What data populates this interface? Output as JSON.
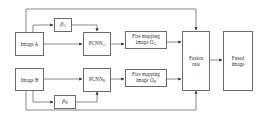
{
  "diagram": {
    "nodes": {
      "image_a": {
        "label": "Image A"
      },
      "beta_a": {
        "symbol": "β",
        "sub": "A"
      },
      "pcnn_a": {
        "label": "PCNN",
        "sub": "A"
      },
      "fire_a": {
        "line1": "Fire mapping",
        "line2": "image O",
        "sub": "A"
      },
      "image_b": {
        "label": "Image B"
      },
      "beta_b": {
        "symbol": "β",
        "sub": "B"
      },
      "pcnn_b": {
        "label": "PCNN",
        "sub": "B"
      },
      "fire_b": {
        "line1": "Fire mapping",
        "line2": "image O",
        "sub": "B"
      },
      "fusion": {
        "line1": "Fusion",
        "line2": "rule"
      },
      "fused": {
        "line1": "Fused",
        "line2": "image"
      }
    },
    "edges": [
      "Image A -> β_A",
      "β_A -> PCNN_A",
      "Image A -> PCNN_A",
      "PCNN_A -> Fire mapping image O_A",
      "Fire mapping image O_A -> Fusion rule",
      "Image A -> Fusion rule (top)",
      "Image B -> β_B",
      "β_B -> PCNN_B",
      "Image B -> PCNN_B",
      "PCNN_B -> Fire mapping image O_B",
      "Fire mapping image O_B -> Fusion rule",
      "Image B -> Fusion rule (bottom)",
      "Fusion rule -> Fused image"
    ],
    "colors": {
      "stroke": "#6b6b6b",
      "background": "#ffffff"
    }
  }
}
